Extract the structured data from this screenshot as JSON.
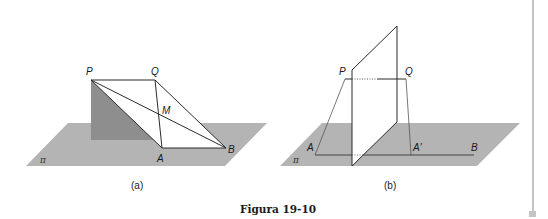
{
  "caption": "Figura 19-10",
  "colors": {
    "plane": "#b4b4b4",
    "shadow_triangle": "#8e8e8e",
    "line": "#2b2b2b",
    "thin_line": "#555555",
    "edge_bar": "#c4c4c4"
  },
  "panel_a": {
    "sublabel": "(a)",
    "plane_label": "π",
    "points": {
      "P": "P",
      "Q": "Q",
      "M": "M",
      "A": "A",
      "B": "B"
    }
  },
  "panel_b": {
    "sublabel": "(b)",
    "plane_label": "π",
    "points": {
      "P": "P",
      "Q": "Q",
      "A": "A",
      "A_prime": "A′",
      "B": "B"
    }
  }
}
